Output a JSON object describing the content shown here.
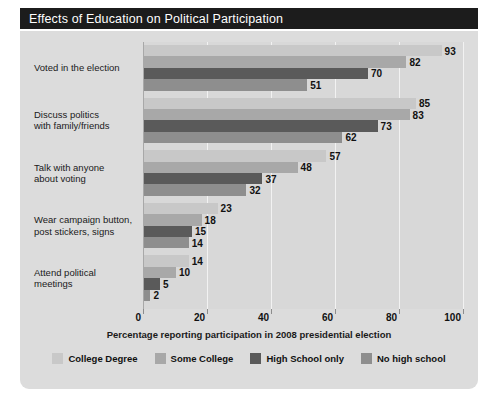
{
  "title": "Effects of Education on Political Participation",
  "chart_data": {
    "type": "bar",
    "orientation": "horizontal",
    "title": "Effects of Education on Political Participation",
    "xlabel": "Percentage reporting participation in 2008 presidential election",
    "ylabel": "",
    "xlim": [
      0,
      100
    ],
    "xticks": [
      "0",
      "20",
      "40",
      "60",
      "80",
      "100"
    ],
    "grid": true,
    "legend_position": "bottom",
    "categories": [
      "Voted in the election",
      "Discuss politics with family/friends",
      "Talk with anyone about voting",
      "Wear campaign button, post stickers, signs",
      "Attend political meetings"
    ],
    "category_lines": [
      [
        "Voted in the election"
      ],
      [
        "Discuss politics",
        "with family/friends"
      ],
      [
        "Talk with anyone",
        "about voting"
      ],
      [
        "Wear campaign button,",
        "post stickers, signs"
      ],
      [
        "Attend political",
        "meetings"
      ]
    ],
    "series": [
      {
        "name": "College Degree",
        "color": "#c8c8c8",
        "values": [
          93,
          85,
          57,
          23,
          14
        ]
      },
      {
        "name": "Some College",
        "color": "#a8a8a8",
        "values": [
          82,
          83,
          48,
          18,
          10
        ]
      },
      {
        "name": "High School only",
        "color": "#5a5a5a",
        "values": [
          70,
          73,
          37,
          15,
          5
        ]
      },
      {
        "name": "No high school",
        "color": "#8e8e8e",
        "values": [
          51,
          62,
          32,
          14,
          2
        ]
      }
    ]
  },
  "colors": {
    "title_bar_bg": "#1c1c1c",
    "title_bar_text": "#ffffff",
    "card_bg": "#dcdcdc",
    "plot_bg": "#d8d8d8",
    "gridline": "#f2f2f2",
    "axis": "#a8a8a8",
    "text": "#1a1a1a"
  }
}
